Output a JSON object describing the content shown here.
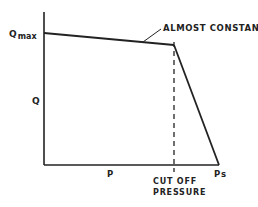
{
  "diagram": {
    "type": "flow-pressure characteristic",
    "labels": {
      "y_axis": "Q",
      "y_max_main": "Q",
      "y_max_sub": "max",
      "x_axis": "P",
      "x_end": "Ps",
      "cutoff_line1": "CUT OFF",
      "cutoff_line2": "PRESSURE",
      "annotation": "ALMOST CONSTANT"
    },
    "colors": {
      "line": "#222222",
      "background": "#ffffff"
    },
    "points": {
      "origin": [
        44,
        165
      ],
      "y_axis_top": [
        44,
        12
      ],
      "x_axis_end": [
        219,
        165
      ],
      "qmax_start": [
        44,
        33
      ],
      "cutoff_point": [
        174,
        45
      ],
      "ps_point": [
        219,
        165
      ],
      "dashed_bottom": [
        174,
        172
      ]
    }
  }
}
